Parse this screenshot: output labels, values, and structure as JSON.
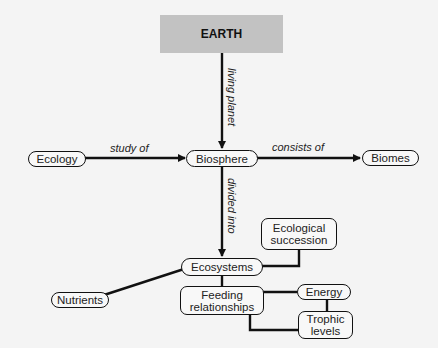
{
  "title_node": "EARTH",
  "nodes": {
    "ecology": "Ecology",
    "biosphere": "Biosphere",
    "biomes": "Biomes",
    "ecosystems": "Ecosystems",
    "ecological_succession": "Ecological succession",
    "nutrients": "Nutrients",
    "feeding_relationships": "Feeding relationships",
    "energy": "Energy",
    "trophic_levels": "Trophic levels"
  },
  "links": {
    "living_planet": "living planet",
    "study_of": "study of",
    "consists_of": "consists of",
    "divided_into": "divided into"
  },
  "colors": {
    "title_bg": "#c2c2c2",
    "line": "#111111",
    "background": "#f4f4f4"
  }
}
